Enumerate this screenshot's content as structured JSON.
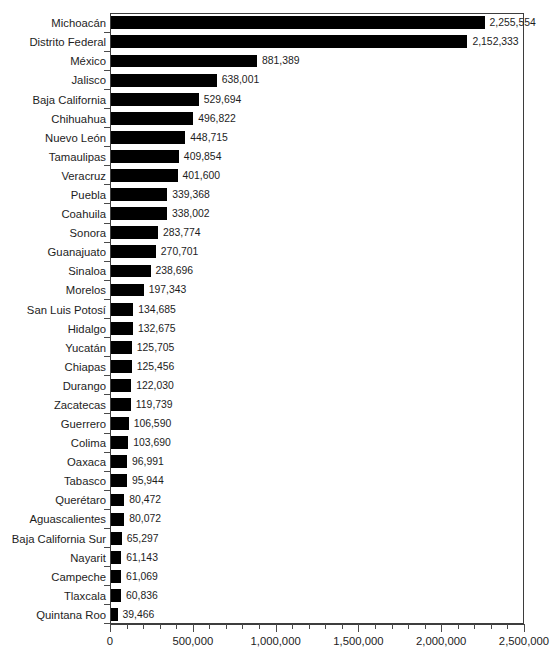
{
  "chart_data": {
    "type": "bar",
    "orientation": "horizontal",
    "title": "",
    "subtitle": "",
    "xlabel": "",
    "ylabel": "",
    "xlim": [
      0,
      2500000
    ],
    "grid": false,
    "legend": null,
    "axis": {
      "tick_labels": [
        "0",
        "500,000",
        "1,000,000",
        "1,500,000",
        "2,000,000",
        "2,500,000"
      ],
      "tick_values": [
        0,
        500000,
        1000000,
        1500000,
        2000000,
        2500000
      ],
      "minor_tick_interval": 100000
    },
    "categories": [
      "Michoacán",
      "Distrito Federal",
      "México",
      "Jalisco",
      "Baja California",
      "Chihuahua",
      "Nuevo León",
      "Tamaulipas",
      "Veracruz",
      "Puebla",
      "Coahuila",
      "Sonora",
      "Guanajuato",
      "Sinaloa",
      "Morelos",
      "San Luis Potosí",
      "Hidalgo",
      "Yucatán",
      "Chiapas",
      "Durango",
      "Zacatecas",
      "Guerrero",
      "Colima",
      "Oaxaca",
      "Tabasco",
      "Querétaro",
      "Aguascalientes",
      "Baja California Sur",
      "Nayarit",
      "Campeche",
      "Tlaxcala",
      "Quintana Roo"
    ],
    "values": [
      2255554,
      2152333,
      881389,
      638001,
      529694,
      496822,
      448715,
      409854,
      401600,
      339368,
      338002,
      283774,
      270701,
      238696,
      197343,
      134685,
      132675,
      125705,
      125456,
      122030,
      119739,
      106590,
      103690,
      96991,
      95944,
      80472,
      80072,
      65297,
      61143,
      61069,
      60836,
      39466
    ],
    "value_labels": [
      "2,255,554",
      "2,152,333",
      "881,389",
      "638,001",
      "529,694",
      "496,822",
      "448,715",
      "409,854",
      "401,600",
      "339,368",
      "338,002",
      "283,774",
      "270,701",
      "238,696",
      "197,343",
      "134,685",
      "132,675",
      "125,705",
      "125,456",
      "122,030",
      "119,739",
      "106,590",
      "103,690",
      "96,991",
      "95,944",
      "80,472",
      "80,072",
      "65,297",
      "61,143",
      "61,069",
      "60,836",
      "39,466"
    ],
    "colors": {
      "bar": "#000000",
      "background": "#ffffff",
      "axis": "#3d3d3d",
      "text": "#1d1d1d"
    }
  }
}
